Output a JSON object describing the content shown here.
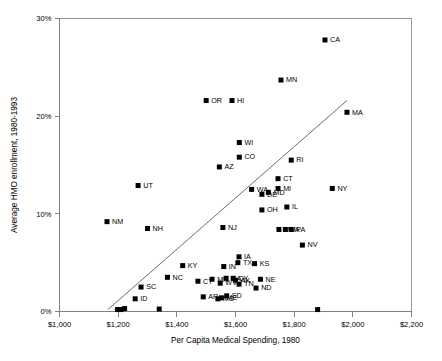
{
  "chart_data": {
    "type": "scatter",
    "title": "",
    "xlabel": "Per Capita Medical Spending, 1980",
    "ylabel": "Average HMO enrollment, 1980-1993",
    "xlim": [
      1000,
      2200
    ],
    "ylim": [
      0,
      30
    ],
    "xtick_labels": [
      "$1,000",
      "$1,200",
      "$1,400",
      "$1,600",
      "$1,800",
      "$2,000",
      "$2,200"
    ],
    "xticks": [
      1000,
      1200,
      1400,
      1600,
      1800,
      2000,
      2200
    ],
    "ytick_labels": [
      "0%",
      "10%",
      "20%",
      "30%"
    ],
    "yticks": [
      0,
      10,
      20,
      30
    ],
    "grid": false,
    "legend": "none",
    "marker": "filled-square",
    "marker_color": "#000000",
    "trend_line": {
      "label": "regression line",
      "x_start": 1165,
      "y_start": 0.2,
      "x_end": 1980,
      "y_end": 21.6,
      "color": "#6e6e6e"
    },
    "points": [
      {
        "label": "CA",
        "x": 1905,
        "y": 27.8
      },
      {
        "label": "MN",
        "x": 1755,
        "y": 23.7
      },
      {
        "label": "OR",
        "x": 1500,
        "y": 21.6
      },
      {
        "label": "HI",
        "x": 1588,
        "y": 21.6
      },
      {
        "label": "MA",
        "x": 1980,
        "y": 20.4
      },
      {
        "label": "WI",
        "x": 1613,
        "y": 17.3
      },
      {
        "label": "CO",
        "x": 1613,
        "y": 15.8
      },
      {
        "label": "RI",
        "x": 1790,
        "y": 15.5
      },
      {
        "label": "AZ",
        "x": 1545,
        "y": 14.8
      },
      {
        "label": "CT",
        "x": 1745,
        "y": 13.6
      },
      {
        "label": "MI",
        "x": 1745,
        "y": 12.6
      },
      {
        "label": "UT",
        "x": 1268,
        "y": 12.9
      },
      {
        "label": "NY",
        "x": 1930,
        "y": 12.6
      },
      {
        "label": "WA",
        "x": 1655,
        "y": 12.5
      },
      {
        "label": "DE",
        "x": 1690,
        "y": 12.0
      },
      {
        "label": "MD",
        "x": 1712,
        "y": 12.2
      },
      {
        "label": "IL",
        "x": 1775,
        "y": 10.7
      },
      {
        "label": "OH",
        "x": 1690,
        "y": 10.4
      },
      {
        "label": "NM",
        "x": 1162,
        "y": 9.2
      },
      {
        "label": "NH",
        "x": 1300,
        "y": 8.5
      },
      {
        "label": "NJ",
        "x": 1557,
        "y": 8.6
      },
      {
        "label": "MO",
        "x": 1748,
        "y": 8.4
      },
      {
        "label": "VA",
        "x": 1770,
        "y": 8.4
      },
      {
        "label": "PA",
        "x": 1790,
        "y": 8.4
      },
      {
        "label": "NV",
        "x": 1828,
        "y": 6.8
      },
      {
        "label": "IA",
        "x": 1612,
        "y": 5.6
      },
      {
        "label": "TX",
        "x": 1608,
        "y": 5.0
      },
      {
        "label": "KS",
        "x": 1665,
        "y": 4.9
      },
      {
        "label": "KY",
        "x": 1420,
        "y": 4.7
      },
      {
        "label": "IN",
        "x": 1560,
        "y": 4.6
      },
      {
        "label": "NC",
        "x": 1368,
        "y": 3.5
      },
      {
        "label": "GA",
        "x": 1568,
        "y": 3.4
      },
      {
        "label": "OK",
        "x": 1592,
        "y": 3.4
      },
      {
        "label": "AK",
        "x": 1600,
        "y": 3.2
      },
      {
        "label": "NE",
        "x": 1685,
        "y": 3.3
      },
      {
        "label": "MN2",
        "x": 1520,
        "y": 3.3
      },
      {
        "label": "WV",
        "x": 1548,
        "y": 2.9
      },
      {
        "label": "TN",
        "x": 1612,
        "y": 2.8
      },
      {
        "label": "ND",
        "x": 1670,
        "y": 2.4
      },
      {
        "label": "CT2",
        "x": 1472,
        "y": 3.1
      },
      {
        "label": "SC",
        "x": 1278,
        "y": 2.5
      },
      {
        "label": "AR",
        "x": 1490,
        "y": 1.5
      },
      {
        "label": "ME",
        "x": 1552,
        "y": 1.4
      },
      {
        "label": "SD",
        "x": 1570,
        "y": 1.6
      },
      {
        "label": "MS",
        "x": 1540,
        "y": 1.3
      },
      {
        "label": "ID",
        "x": 1258,
        "y": 1.3
      },
      {
        "label": "",
        "x": 1198,
        "y": 0.2
      },
      {
        "label": "",
        "x": 1210,
        "y": 0.2
      },
      {
        "label": "",
        "x": 1222,
        "y": 0.3
      },
      {
        "label": "",
        "x": 1340,
        "y": 0.25
      },
      {
        "label": "",
        "x": 1880,
        "y": 0.2
      }
    ]
  },
  "labels_visible": [
    "CA",
    "MN",
    "OR",
    "HI",
    "MA",
    "WI",
    "CO",
    "RI",
    "AZ",
    "CT",
    "MI",
    "UT",
    "NY",
    "WA",
    "DE",
    "MD",
    "IL",
    "OH",
    "NM",
    "NH",
    "NJ",
    "MO",
    "VA",
    "PA",
    "NV",
    "IA",
    "TX",
    "KS",
    "KY",
    "IN",
    "NC",
    "GA",
    "OK",
    "AK",
    "NE",
    "WV",
    "TN",
    "ND",
    "SC",
    "AR",
    "ME",
    "SD",
    "MS",
    "ID"
  ]
}
